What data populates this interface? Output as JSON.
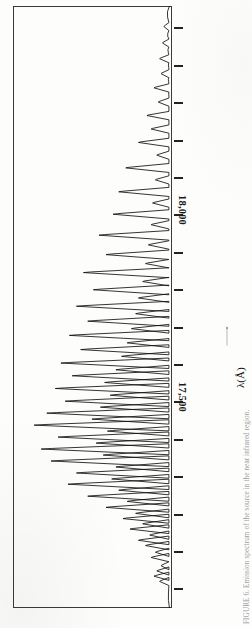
{
  "figure": {
    "kind": "scanned-spectrum-figure",
    "orientation": "rotated-90-ccw",
    "caption": "FIGURE 6. Emission spectrum of the source in the near infrared region.",
    "frame_color": "#3a3a3a",
    "trace_color": "#111111"
  },
  "axis": {
    "title": "λ(Å)",
    "arrow": "→",
    "tick_labels": [
      {
        "text": "17,500",
        "value": 17500
      },
      {
        "text": "18,000",
        "value": 18000
      }
    ],
    "tick_values": [
      17000,
      17100,
      17200,
      17300,
      17400,
      17500,
      17600,
      17700,
      17800,
      17900,
      18000,
      18100,
      18200,
      18300,
      18400,
      18500
    ],
    "range_label_min": "17,500",
    "range_label_max": "18,000"
  },
  "chart_data": {
    "type": "line",
    "title": "",
    "subtitle": "",
    "xlabel": "λ(Å)",
    "ylabel": "Intensity",
    "xlim": [
      16950,
      18560
    ],
    "ylim": [
      0,
      1
    ],
    "grid": false,
    "legend": null,
    "annotations": [
      "17,500",
      "18,000"
    ],
    "tick_labelled_x": [
      17500,
      18000
    ],
    "tick_all_x": [
      17000,
      17100,
      17200,
      17300,
      17400,
      17500,
      17600,
      17700,
      17800,
      17900,
      18000,
      18100,
      18200,
      18300,
      18400,
      18500
    ],
    "note": "Emission line spectrum; baseline at intensity 0, sharp peaks of varying height. x = wavelength in Angstrom, y = normalised intensity (0-1).",
    "peaks": [
      {
        "x": 17022,
        "y": 0.07
      },
      {
        "x": 17036,
        "y": 0.11
      },
      {
        "x": 17050,
        "y": 0.09
      },
      {
        "x": 17064,
        "y": 0.06
      },
      {
        "x": 17086,
        "y": 0.13
      },
      {
        "x": 17100,
        "y": 0.1
      },
      {
        "x": 17118,
        "y": 0.17
      },
      {
        "x": 17132,
        "y": 0.22
      },
      {
        "x": 17146,
        "y": 0.14
      },
      {
        "x": 17162,
        "y": 0.28
      },
      {
        "x": 17176,
        "y": 0.19
      },
      {
        "x": 17190,
        "y": 0.33
      },
      {
        "x": 17204,
        "y": 0.24
      },
      {
        "x": 17220,
        "y": 0.45
      },
      {
        "x": 17236,
        "y": 0.3
      },
      {
        "x": 17250,
        "y": 0.58
      },
      {
        "x": 17266,
        "y": 0.36
      },
      {
        "x": 17282,
        "y": 0.72
      },
      {
        "x": 17296,
        "y": 0.41
      },
      {
        "x": 17312,
        "y": 0.66
      },
      {
        "x": 17328,
        "y": 0.38
      },
      {
        "x": 17344,
        "y": 0.84
      },
      {
        "x": 17360,
        "y": 0.47
      },
      {
        "x": 17376,
        "y": 0.91
      },
      {
        "x": 17392,
        "y": 0.52
      },
      {
        "x": 17408,
        "y": 0.79
      },
      {
        "x": 17424,
        "y": 0.44
      },
      {
        "x": 17440,
        "y": 0.96
      },
      {
        "x": 17456,
        "y": 0.55
      },
      {
        "x": 17472,
        "y": 0.87
      },
      {
        "x": 17488,
        "y": 0.49
      },
      {
        "x": 17504,
        "y": 0.74
      },
      {
        "x": 17520,
        "y": 0.42
      },
      {
        "x": 17538,
        "y": 0.81
      },
      {
        "x": 17554,
        "y": 0.46
      },
      {
        "x": 17572,
        "y": 0.69
      },
      {
        "x": 17588,
        "y": 0.38
      },
      {
        "x": 17606,
        "y": 0.77
      },
      {
        "x": 17624,
        "y": 0.34
      },
      {
        "x": 17642,
        "y": 0.63
      },
      {
        "x": 17660,
        "y": 0.3
      },
      {
        "x": 17680,
        "y": 0.71
      },
      {
        "x": 17698,
        "y": 0.27
      },
      {
        "x": 17718,
        "y": 0.58
      },
      {
        "x": 17738,
        "y": 0.24
      },
      {
        "x": 17758,
        "y": 0.66
      },
      {
        "x": 17780,
        "y": 0.22
      },
      {
        "x": 17802,
        "y": 0.54
      },
      {
        "x": 17824,
        "y": 0.19
      },
      {
        "x": 17848,
        "y": 0.61
      },
      {
        "x": 17872,
        "y": 0.17
      },
      {
        "x": 17896,
        "y": 0.45
      },
      {
        "x": 17922,
        "y": 0.15
      },
      {
        "x": 17948,
        "y": 0.5
      },
      {
        "x": 17976,
        "y": 0.13
      },
      {
        "x": 18004,
        "y": 0.4
      },
      {
        "x": 18034,
        "y": 0.12
      },
      {
        "x": 18064,
        "y": 0.36
      },
      {
        "x": 18096,
        "y": 0.1
      },
      {
        "x": 18128,
        "y": 0.31
      },
      {
        "x": 18162,
        "y": 0.09
      },
      {
        "x": 18196,
        "y": 0.22
      },
      {
        "x": 18232,
        "y": 0.13
      },
      {
        "x": 18268,
        "y": 0.16
      },
      {
        "x": 18304,
        "y": 0.08
      },
      {
        "x": 18342,
        "y": 0.11
      },
      {
        "x": 18380,
        "y": 0.06
      },
      {
        "x": 18420,
        "y": 0.07
      },
      {
        "x": 18462,
        "y": 0.05
      },
      {
        "x": 18506,
        "y": 0.04
      }
    ]
  }
}
